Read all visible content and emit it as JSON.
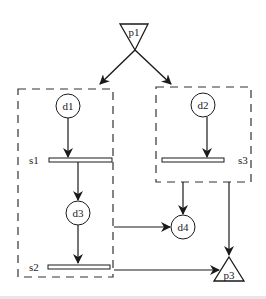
{
  "diagram": {
    "nodes": {
      "p1": {
        "label": "p1",
        "shape": "triangle-down"
      },
      "p3": {
        "label": "p3",
        "shape": "triangle-up"
      },
      "d1": {
        "label": "d1",
        "shape": "circle"
      },
      "d2": {
        "label": "d2",
        "shape": "circle"
      },
      "d3": {
        "label": "d3",
        "shape": "circle"
      },
      "d4": {
        "label": "d4",
        "shape": "circle"
      },
      "s1": {
        "label": "s1",
        "shape": "bar"
      },
      "s2": {
        "label": "s2",
        "shape": "bar"
      },
      "s3": {
        "label": "s3",
        "shape": "bar"
      }
    },
    "groups": [
      {
        "name": "left-group",
        "contains": [
          "d1",
          "s1",
          "d3",
          "s2"
        ],
        "style": "dashed"
      },
      {
        "name": "right-group",
        "contains": [
          "d2",
          "s3"
        ],
        "style": "dashed"
      }
    ],
    "edges": [
      {
        "from": "p1",
        "to": "left-group"
      },
      {
        "from": "p1",
        "to": "right-group"
      },
      {
        "from": "d1",
        "to": "s1"
      },
      {
        "from": "s1",
        "to": "d3"
      },
      {
        "from": "d3",
        "to": "s2"
      },
      {
        "from": "d2",
        "to": "s3"
      },
      {
        "from": "left-group",
        "to": "d4"
      },
      {
        "from": "right-group",
        "to": "d4"
      },
      {
        "from": "right-group",
        "to": "p3"
      },
      {
        "from": "s2",
        "to": "p3"
      }
    ],
    "colors": {
      "stroke": "#1a1a1a",
      "background": "#ffffff"
    }
  }
}
